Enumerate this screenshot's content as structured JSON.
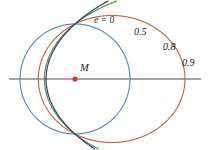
{
  "figure": {
    "background_color": "#ffffff",
    "width": 208,
    "height": 150
  },
  "focus": {
    "marker_label": "M",
    "marker_color": "#e8322a",
    "x": 75,
    "y": 79,
    "radius": 2.6
  },
  "axis": {
    "label": "major-axis",
    "color_left": "#8c8c8c",
    "color_right": "#3a3a3a",
    "y": 79,
    "x_start": 9,
    "x_end": 201
  },
  "labels": {
    "e0": "e = 0",
    "e05": "0.5",
    "e08": "0.8",
    "e09": "0.9"
  },
  "chart_data": {
    "type": "line",
    "xlabel": "",
    "ylabel": "",
    "grid": false,
    "legend_position": "inline-annotations",
    "semi_latus_rectum_px": 55,
    "focus_px": [
      75,
      79
    ],
    "periapsis_direction": "left",
    "xlim": [
      0,
      208
    ],
    "ylim": [
      150,
      0
    ],
    "series": [
      {
        "name": "e = 0",
        "eccentricity": 0,
        "color": "#5b82c0",
        "stroke_width": 1.15,
        "semi_major_px": 55,
        "semi_minor_px": 55,
        "center_px": [
          75,
          79
        ],
        "periapsis_x": 20,
        "apoapsis_x": 130,
        "top_y": 24,
        "bottom_y": 134,
        "label": "e = 0",
        "label_px": [
          94,
          16
        ]
      },
      {
        "name": "0.5",
        "eccentricity": 0.5,
        "color": "#c8633f",
        "stroke_width": 1.15,
        "semi_major_px": 73.33,
        "semi_minor_px": 63.51,
        "center_px": [
          111.67,
          79
        ],
        "periapsis_x": 38.33,
        "apoapsis_x": 185,
        "top_y": 15.49,
        "bottom_y": 142.51,
        "label": "0.5",
        "label_px": [
          134,
          27
        ]
      },
      {
        "name": "0.8",
        "eccentricity": 0.8,
        "color": "#4f8f56",
        "stroke_width": 1.15,
        "semi_major_px": 152.78,
        "semi_minor_px": 91.67,
        "center_px": [
          197.78,
          79
        ],
        "periapsis_x": 30.56,
        "apoapsis_x": 350.56,
        "top_y": -12.67,
        "bottom_y": 170.67,
        "label": "0.8",
        "label_px": [
          163,
          42
        ]
      },
      {
        "name": "0.9",
        "eccentricity": 0.9,
        "color": "#39486b",
        "stroke_width": 1.3,
        "semi_major_px": 289.47,
        "semi_minor_px": 126.15,
        "center_px": [
          335.47,
          79
        ],
        "periapsis_x": 28.95,
        "apoapsis_x": 624.47,
        "top_y": -47.15,
        "bottom_y": 205.15,
        "label": "0.9",
        "label_px": [
          182,
          58
        ]
      }
    ]
  }
}
